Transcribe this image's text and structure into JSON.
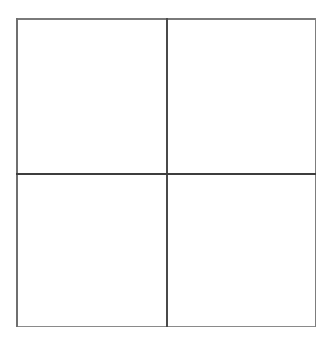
{
  "figure": {
    "title": "",
    "background_color": "#ffffff",
    "width": 333,
    "height": 340
  },
  "grid": {
    "name": "2x2-grid",
    "rows": 2,
    "columns": 2,
    "frame": {
      "left": 16,
      "top": 18,
      "width": 300,
      "height": 309
    },
    "border": {
      "top_color": "#7a7a7a",
      "bottom_color": "#8a8a8a",
      "left_color": "#6f6f6f",
      "right_color": "#7d7d7d",
      "width_px": 1.5
    },
    "dividers": {
      "vertical": {
        "offset_from_left": 150,
        "color": "#4a4a4a",
        "width_px": 1.8
      },
      "horizontal": {
        "offset_from_top": 155,
        "color": "#3d3d3d",
        "width_px": 2
      }
    },
    "cells": [
      {
        "id": "top-left",
        "label": "",
        "fill": "#ffffff"
      },
      {
        "id": "top-right",
        "label": "",
        "fill": "#ffffff"
      },
      {
        "id": "bottom-left",
        "label": "",
        "fill": "#ffffff"
      },
      {
        "id": "bottom-right",
        "label": "",
        "fill": "#ffffff"
      }
    ]
  }
}
